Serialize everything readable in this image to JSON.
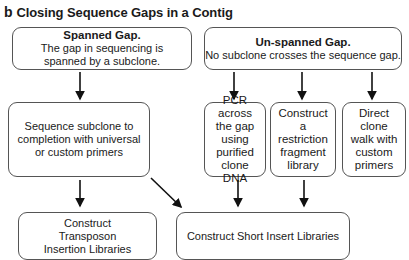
{
  "figure": {
    "panel_label": "b",
    "title": "Closing Sequence Gaps in a Contig"
  },
  "nodes": {
    "spanned": {
      "heading": "Spanned Gap.",
      "body": "The gap in sequencing is spanned by a subclone."
    },
    "unspanned": {
      "heading": "Un-spanned Gap.",
      "body": "No subclone crosses the sequence gap."
    },
    "sequence_subclone": {
      "text": "Sequence subclone to completion with universal or custom primers"
    },
    "pcr": {
      "text": "PCR across the gap using purified clone DNA"
    },
    "restriction": {
      "text": "Construct a restriction fragment library"
    },
    "clone_walk": {
      "text": "Direct clone walk with custom primers"
    },
    "transposon": {
      "text": "Construct Transposon Insertion Libraries"
    },
    "short_insert": {
      "text": "Construct Short Insert Libraries"
    }
  },
  "edges": [
    {
      "from": "spanned",
      "to": "sequence_subclone"
    },
    {
      "from": "unspanned",
      "to": "pcr"
    },
    {
      "from": "unspanned",
      "to": "restriction"
    },
    {
      "from": "unspanned",
      "to": "clone_walk"
    },
    {
      "from": "sequence_subclone",
      "to": "transposon"
    },
    {
      "from": "sequence_subclone",
      "to": "short_insert"
    },
    {
      "from": "pcr",
      "to": "short_insert"
    },
    {
      "from": "restriction",
      "to": "short_insert"
    }
  ],
  "colors": {
    "line": "#111111",
    "border": "#555555",
    "background": "#ffffff"
  }
}
